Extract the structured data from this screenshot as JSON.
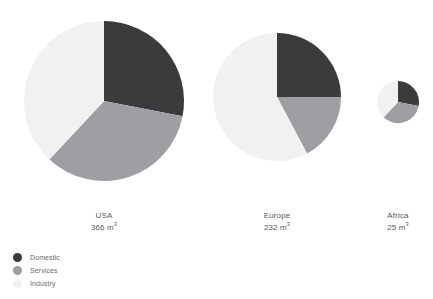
{
  "chart_data": {
    "type": "pie",
    "title": "",
    "subtitle": "",
    "xlabel": "",
    "ylabel": "",
    "legend_position": "bottom-left",
    "grid": false,
    "unit": "m³",
    "categories": [
      "Domestic",
      "Services",
      "Industry"
    ],
    "colors": {
      "Domestic": "#3b3b3d",
      "Services": "#9d9fa2",
      "Industry": "#f1f1f1",
      "background": "#ffffff",
      "text": "#59595b"
    },
    "series": [
      {
        "name": "USA",
        "total": 366,
        "total_label": "366 m",
        "unit_exponent": "3",
        "radius_px": 80,
        "slices": [
          {
            "label": "Domestic",
            "percent": 28,
            "start_angle_deg": 0,
            "end_angle_deg": 101
          },
          {
            "label": "Services",
            "percent": 34,
            "start_angle_deg": 101,
            "end_angle_deg": 223
          },
          {
            "label": "Industry",
            "percent": 38,
            "start_angle_deg": 223,
            "end_angle_deg": 360
          }
        ]
      },
      {
        "name": "Europe",
        "total": 232,
        "total_label": "232 m",
        "unit_exponent": "3",
        "radius_px": 64,
        "slices": [
          {
            "label": "Domestic",
            "percent": 25,
            "start_angle_deg": 0,
            "end_angle_deg": 90
          },
          {
            "label": "Services",
            "percent": 17,
            "start_angle_deg": 90,
            "end_angle_deg": 152
          },
          {
            "label": "Industry",
            "percent": 58,
            "start_angle_deg": 152,
            "end_angle_deg": 360
          }
        ]
      },
      {
        "name": "Africa",
        "total": 25,
        "total_label": "25 m",
        "unit_exponent": "3",
        "radius_px": 21,
        "slices": [
          {
            "label": "Domestic",
            "percent": 28,
            "start_angle_deg": 0,
            "end_angle_deg": 101
          },
          {
            "label": "Services",
            "percent": 34,
            "start_angle_deg": 101,
            "end_angle_deg": 223
          },
          {
            "label": "Industry",
            "percent": 38,
            "start_angle_deg": 223,
            "end_angle_deg": 360
          }
        ]
      }
    ]
  },
  "pies": {
    "usa": {
      "name": "USA",
      "value": "366 m",
      "exp": "3",
      "cx": 104,
      "cy": 101,
      "r": 80,
      "label_top": 210,
      "label_left": 104
    },
    "europe": {
      "name": "Europe",
      "value": "232 m",
      "exp": "3",
      "cx": 277,
      "cy": 97,
      "r": 64,
      "label_top": 210,
      "label_left": 277
    },
    "africa": {
      "name": "Africa",
      "value": "25 m",
      "exp": "3",
      "cx": 398,
      "cy": 102,
      "r": 21,
      "label_top": 210,
      "label_left": 398
    }
  },
  "legend": {
    "items": [
      {
        "label": "Domestic",
        "color": "#3b3b3d"
      },
      {
        "label": "Services",
        "color": "#9d9fa2"
      },
      {
        "label": "Industry",
        "color": "#f1f1f1"
      }
    ]
  }
}
